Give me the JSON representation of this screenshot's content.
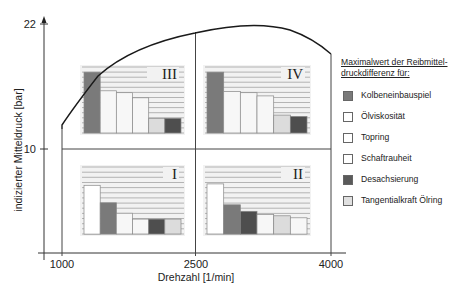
{
  "chart_data": {
    "type": "bar",
    "title": "",
    "xlabel": "Drehzahl [1/min]",
    "ylabel": "indizierter Mitteldruck [bar]",
    "x_ticks": [
      "1000",
      "2500",
      "4000"
    ],
    "y_ticks": [
      "10",
      "22"
    ],
    "xlim": [
      1000,
      4000
    ],
    "ylim_ticks": [
      10,
      22
    ],
    "grid": false,
    "legend_position": "right",
    "full_load_curve": {
      "description": "Volllastlinie (full-load curve) of indicated mean pressure vs engine speed",
      "points": [
        [
          1000,
          13.1
        ],
        [
          1200,
          15.5
        ],
        [
          1500,
          18.0
        ],
        [
          2000,
          20.3
        ],
        [
          2500,
          21.5
        ],
        [
          3000,
          22.0
        ],
        [
          3500,
          21.3
        ],
        [
          4000,
          19.4
        ]
      ]
    },
    "quadrant_divisions": {
      "x": 2500,
      "y": 10
    },
    "legend_title": "Maximalwert der Reibmittel-druckdifferenz für:",
    "series_order": [
      "Kolbeneinbauspiel",
      "Ölviskosität",
      "Topring",
      "Schaftrauheit",
      "Desachsierung",
      "Tangentialkraft Ölring"
    ],
    "panels": [
      {
        "id": "III",
        "region": "low speed / high load",
        "bars": [
          {
            "series": "Kolbeneinbauspiel",
            "value": 9.5,
            "fill": "#7a7a7a"
          },
          {
            "series": "Ölviskosität",
            "value": 6.6,
            "fill": "#f7f7f7"
          },
          {
            "series": "Topring",
            "value": 6.3,
            "fill": "#f7f7f7"
          },
          {
            "series": "Schaftrauheit",
            "value": 5.5,
            "fill": "#f7f7f7"
          },
          {
            "series": "Tangentialkraft Ölring",
            "value": 2.3,
            "fill": "#dcdcdc"
          },
          {
            "series": "Desachsierung",
            "value": 2.3,
            "fill": "#4e4e4e"
          }
        ]
      },
      {
        "id": "IV",
        "region": "high speed / high load",
        "bars": [
          {
            "series": "Kolbeneinbauspiel",
            "value": 9.5,
            "fill": "#7a7a7a"
          },
          {
            "series": "Ölviskosität",
            "value": 6.5,
            "fill": "#f7f7f7"
          },
          {
            "series": "Topring",
            "value": 6.3,
            "fill": "#f7f7f7"
          },
          {
            "series": "Schaftrauheit",
            "value": 5.8,
            "fill": "#f7f7f7"
          },
          {
            "series": "Tangentialkraft Ölring",
            "value": 2.8,
            "fill": "#dcdcdc"
          },
          {
            "series": "Desachsierung",
            "value": 2.6,
            "fill": "#4e4e4e"
          }
        ]
      },
      {
        "id": "I",
        "region": "low speed / low load",
        "bars": [
          {
            "series": "Ölviskosität",
            "value": 7.5,
            "fill": "#ffffff"
          },
          {
            "series": "Kolbeneinbauspiel",
            "value": 4.8,
            "fill": "#7a7a7a"
          },
          {
            "series": "Topring",
            "value": 3.2,
            "fill": "#f7f7f7"
          },
          {
            "series": "Schaftrauheit",
            "value": 2.3,
            "fill": "#f7f7f7"
          },
          {
            "series": "Desachsierung",
            "value": 2.3,
            "fill": "#4e4e4e"
          },
          {
            "series": "Tangentialkraft Ölring",
            "value": 2.3,
            "fill": "#dcdcdc"
          }
        ]
      },
      {
        "id": "II",
        "region": "high speed / low load",
        "bars": [
          {
            "series": "Ölviskosität",
            "value": 7.7,
            "fill": "#ffffff"
          },
          {
            "series": "Kolbeneinbauspiel",
            "value": 4.5,
            "fill": "#7a7a7a"
          },
          {
            "series": "Desachsierung",
            "value": 3.5,
            "fill": "#4e4e4e"
          },
          {
            "series": "Topring",
            "value": 3.0,
            "fill": "#f7f7f7"
          },
          {
            "series": "Tangentialkraft Ölring",
            "value": 2.8,
            "fill": "#dcdcdc"
          },
          {
            "series": "Schaftrauheit",
            "value": 2.5,
            "fill": "#f7f7f7"
          }
        ]
      }
    ]
  },
  "axes": {
    "x_title": "Drehzahl [1/min]",
    "y_title": "indizierter Mitteldruck [bar]",
    "x_ticks": [
      "1000",
      "2500",
      "4000"
    ],
    "y_ticks": [
      "22",
      "10"
    ]
  },
  "legend": {
    "title_line1": "Maximalwert der Reibmittel-",
    "title_line2": "druckdifferenz für:",
    "items": [
      {
        "label": "Kolbeneinbauspiel",
        "color": "#7a7a7a"
      },
      {
        "label": "Ölviskosität",
        "color": "#ffffff"
      },
      {
        "label": "Topring",
        "color": "#ffffff"
      },
      {
        "label": "Schaftrauheit",
        "color": "#ffffff"
      },
      {
        "label": "Desachsierung",
        "color": "#5a5a5a"
      },
      {
        "label": "Tangentialkraft Ölring",
        "color": "#e0e0e0"
      }
    ]
  },
  "colors": {
    "axis": "#333333",
    "curve": "#1a1a1a",
    "panel_bg": "#f2f2f2",
    "panel_lines": "#9a9a9a",
    "bar_stroke": "#888888"
  }
}
